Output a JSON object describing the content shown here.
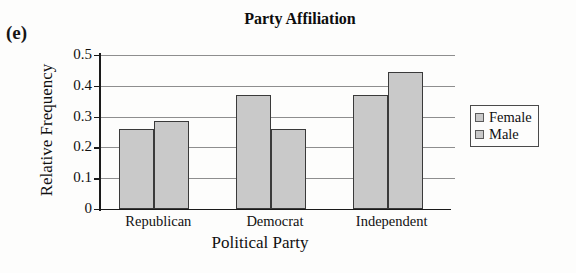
{
  "panel_letter": "(e)",
  "chart_data": {
    "type": "bar",
    "title": "Party Affiliation",
    "xlabel": "Political Party",
    "ylabel": "Relative Frequency",
    "categories": [
      "Republican",
      "Democrat",
      "Independent"
    ],
    "series": [
      {
        "name": "Female",
        "values": [
          0.26,
          0.37,
          0.37
        ],
        "color": "#c9c9c9"
      },
      {
        "name": "Male",
        "values": [
          0.285,
          0.26,
          0.445
        ],
        "color": "#c9c9c9"
      }
    ],
    "ylim": [
      0,
      0.5
    ],
    "yticks": [
      0,
      0.1,
      0.2,
      0.3,
      0.4,
      0.5
    ],
    "yticklabels": [
      "0",
      "0.1",
      "0.2",
      "0.3",
      "0.4",
      "0.5"
    ],
    "grid": true,
    "grid_axis": "y",
    "legend_position": "right",
    "legend": [
      "Female",
      "Male"
    ],
    "bar_edge_color": "#3a3a3a",
    "axis_color": "#1a1a1a",
    "gridline_color": "#8e8e8e"
  }
}
